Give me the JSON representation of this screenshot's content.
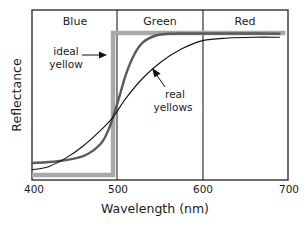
{
  "chart_data": {
    "type": "line",
    "title": "",
    "xlabel": "Wavelength (nm)",
    "ylabel": "Reflectance",
    "xlim": [
      400,
      700
    ],
    "ylim": [
      0,
      1
    ],
    "x_ticks": [
      400,
      500,
      600,
      700
    ],
    "x_tick_labels": [
      "400",
      "500",
      "600",
      "700"
    ],
    "y_ticks": [],
    "grid": false,
    "regions": [
      {
        "label": "Blue",
        "from": 400,
        "to": 500
      },
      {
        "label": "Green",
        "from": 500,
        "to": 600
      },
      {
        "label": "Red",
        "from": 600,
        "to": 700
      }
    ],
    "series": [
      {
        "name": "ideal yellow",
        "style": "thick-light-gray-step",
        "color": "#a8a8a8",
        "x": [
          400,
          495,
          495,
          697
        ],
        "values": [
          0.03,
          0.03,
          0.865,
          0.865
        ]
      },
      {
        "name": "real yellow (steep)",
        "style": "medium-dark-gray",
        "color": "#5a5a5a",
        "x": [
          400,
          430,
          460,
          480,
          490,
          500,
          510,
          520,
          530,
          545,
          560,
          580,
          620,
          660,
          690
        ],
        "values": [
          0.1,
          0.11,
          0.14,
          0.21,
          0.3,
          0.45,
          0.62,
          0.74,
          0.81,
          0.85,
          0.86,
          0.862,
          0.862,
          0.862,
          0.86
        ]
      },
      {
        "name": "real yellow (gradual)",
        "style": "thin-black",
        "color": "#111111",
        "x": [
          400,
          420,
          440,
          460,
          480,
          495,
          510,
          530,
          550,
          575,
          600,
          630,
          660,
          690
        ],
        "values": [
          0.06,
          0.08,
          0.13,
          0.2,
          0.29,
          0.37,
          0.48,
          0.6,
          0.69,
          0.77,
          0.82,
          0.835,
          0.84,
          0.84
        ]
      }
    ],
    "annotations": [
      {
        "text_lines": [
          "ideal",
          "yellow"
        ],
        "arrow_to": "ideal yellow vertical edge",
        "arrow_direction": "right"
      },
      {
        "text_lines": [
          "real",
          "yellows"
        ],
        "arrow_to": "real yellow curves",
        "arrow_direction": "up-left"
      }
    ],
    "legend": null
  },
  "labels": {
    "region_blue": "Blue",
    "region_green": "Green",
    "region_red": "Red",
    "tick_400": "400",
    "tick_500": "500",
    "tick_600": "600",
    "tick_700": "700",
    "xlabel": "Wavelength (nm)",
    "ylabel": "Reflectance",
    "annot_ideal_1": "ideal",
    "annot_ideal_2": "yellow",
    "annot_real_1": "real",
    "annot_real_2": "yellows"
  }
}
